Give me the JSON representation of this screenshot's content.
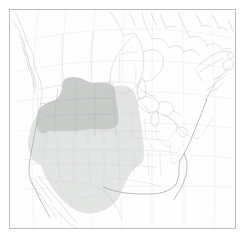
{
  "figure": {
    "kind": "range-map",
    "width_px": 245,
    "height_px": 242,
    "background_color": "#ffffff",
    "frame": {
      "name": "map-frame",
      "color": "#b9bcbf",
      "left_px": 9,
      "top_px": 9,
      "width_px": 227,
      "height_px": 220
    }
  },
  "legend_colors": {
    "base_land_fill": "#ffffff",
    "coastline": "#c9ccce",
    "coastline_emphasis": "#a9adb0",
    "internal_border": "#d2d5d7",
    "state_line": "#cfd2d4",
    "graticule": "#dddfe1",
    "range_light_fill": "#e2e4e2",
    "range_dark_fill": "#c6c9c5"
  },
  "regions": [
    {
      "name": "range-light",
      "label": "Light shaded range",
      "fill": "#e2e4e2",
      "opacity": 0.95,
      "coverage": "Western and south-central United States plus northern Mexico: Washington, Oregon, California, Nevada, Idaho, Utah, Arizona, Montana, Wyoming, Colorado, New Mexico, North Dakota, South Dakota, Nebraska, Kansas, Oklahoma, Texas, western Minnesota / Iowa / Missouri / Arkansas / Louisiana margin"
    },
    {
      "name": "range-dark",
      "label": "Dark shaded core range",
      "fill": "#c6c9c5",
      "opacity": 0.95,
      "coverage": "Northern Rocky Mountains and northern Great Plains: eastern Idaho, Montana, Wyoming, western and central North Dakota, South Dakota, northern Nebraska, northeastern Utah, northwestern Colorado, plus a strip of southern Alberta and Saskatchewan"
    }
  ],
  "geography": {
    "countries": [
      "Canada",
      "United States",
      "Mexico"
    ],
    "water_bodies": [
      "Pacific Ocean",
      "Atlantic Ocean",
      "Gulf of Mexico",
      "Hudson Bay",
      "Great Lakes"
    ],
    "notable_features": [
      "Alaska panhandle and British Columbia coastal islands",
      "Baja California peninsula",
      "Florida peninsula",
      "Hudson Bay",
      "Great Lakes",
      "Newfoundland and Nova Scotia"
    ],
    "graticule": {
      "visible": true,
      "style": "curved latitude and longitude lines, no tick labels"
    }
  },
  "annotations": {
    "has_title_text": false,
    "has_legend_box": false,
    "has_scale_bar": false,
    "has_axis_labels": false,
    "visible_text": ""
  }
}
